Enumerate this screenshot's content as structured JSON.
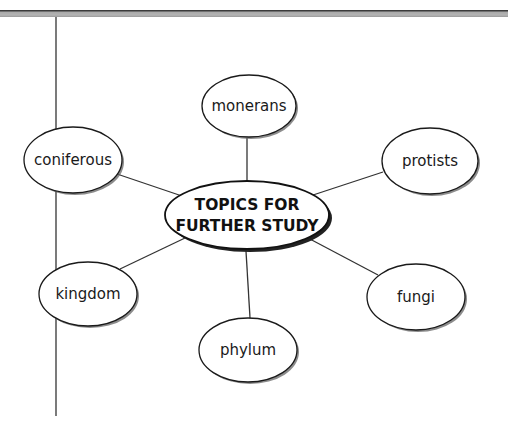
{
  "diagram": {
    "type": "concept-web",
    "center": {
      "line1": "TOPICS FOR",
      "line2": "FURTHER STUDY"
    },
    "nodes": [
      {
        "id": "monerans",
        "label": "monerans"
      },
      {
        "id": "coniferous",
        "label": "coniferous"
      },
      {
        "id": "protists",
        "label": "protists"
      },
      {
        "id": "kingdom",
        "label": "kingdom"
      },
      {
        "id": "fungi",
        "label": "fungi"
      },
      {
        "id": "phylum",
        "label": "phylum"
      }
    ],
    "colors": {
      "stroke": "#1a1a1a",
      "shadow": "#555555",
      "fill": "#ffffff",
      "top_bar": "#a8a8a8"
    }
  }
}
